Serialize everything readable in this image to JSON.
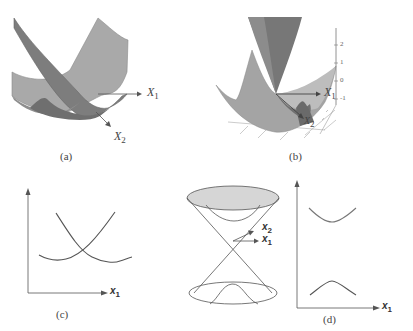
{
  "figure": {
    "panels": [
      {
        "id": "a",
        "caption": "(a)",
        "description": "Two crossing 3D parabolic surfaces (diabatic potential surfaces) with axes",
        "axes": {
          "x1": "X",
          "x1_sub": "1",
          "x2": "X",
          "x2_sub": "2"
        }
      },
      {
        "id": "b",
        "caption": "(b)",
        "description": "3D conical intersection surface with vertical tick axis",
        "axes": {
          "x1": "X",
          "x1_sub": "1",
          "x2": "X",
          "x2_sub": "2"
        },
        "z_ticks": [
          "2",
          "1",
          "0",
          "-1"
        ]
      },
      {
        "id": "c",
        "caption": "(c)",
        "description": "2D plot of two crossing parabolas vs x1",
        "axes": {
          "x": "x",
          "x_sub": "1"
        }
      },
      {
        "id": "d",
        "caption": "(d)",
        "description": "Double cone (conical intersection) with axes, and 2D plot of avoided crossing vs x1",
        "cone_axes": {
          "x1": "x",
          "x1_sub": "1",
          "x2": "x",
          "x2_sub": "2"
        },
        "plot_axes": {
          "x": "x",
          "x_sub": "1"
        }
      }
    ]
  },
  "colors": {
    "surface_light": "#b4b4b4",
    "surface_mid": "#8e8e8e",
    "surface_dark": "#6a6a6a",
    "line": "#555555",
    "cone_fill": "#d6d6d6"
  }
}
